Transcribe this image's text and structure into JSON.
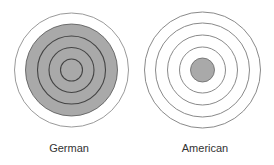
{
  "diagram": {
    "panels": [
      {
        "label": "German",
        "center": [
          71.5,
          70
        ],
        "outer_ring_radius": 57,
        "shaded_disk_radius": 46,
        "inner_ring_radii": [
          34,
          22.5,
          11
        ]
      },
      {
        "label": "American",
        "center": [
          202.5,
          70
        ],
        "ring_radii": [
          58,
          47,
          35,
          23
        ],
        "shaded_disk_radius": 12
      }
    ],
    "colors": {
      "shade": "#a9a9a9",
      "outer_line": "#9a9a9a",
      "inner_line": "#444444"
    }
  }
}
